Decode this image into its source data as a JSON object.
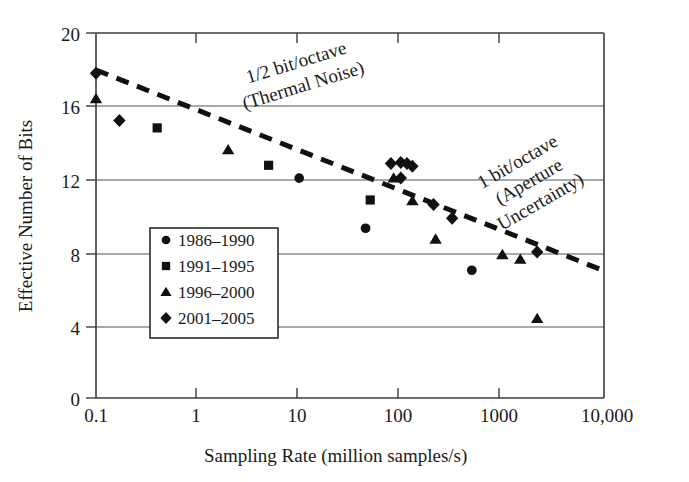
{
  "chart_data": {
    "type": "scatter",
    "title": "",
    "xlabel": "Sampling Rate (million samples/s)",
    "ylabel": "Effective Number of Bits",
    "xscale": "log",
    "yscale": "linear",
    "xlim": [
      0.1,
      10000
    ],
    "ylim": [
      0,
      20
    ],
    "xticks": [
      0.1,
      1,
      10,
      100,
      1000,
      10000
    ],
    "xticklabels": [
      "0.1",
      "1",
      "10",
      "100",
      "1000",
      "10,000"
    ],
    "yticks": [
      0,
      4,
      8,
      12,
      16,
      20
    ],
    "yticklabels": [
      "0",
      "4",
      "8",
      "12",
      "16",
      "20"
    ],
    "grid": "horizontal",
    "legend_position": "lower-left-inside",
    "series": [
      {
        "name": "1986-1990",
        "marker": "circle",
        "points": [
          {
            "x": 10,
            "y": 12.05
          },
          {
            "x": 45,
            "y": 9.3
          },
          {
            "x": 500,
            "y": 7.0
          }
        ]
      },
      {
        "name": "1991-1995",
        "marker": "square",
        "points": [
          {
            "x": 0.4,
            "y": 14.8
          },
          {
            "x": 5,
            "y": 12.75
          },
          {
            "x": 50,
            "y": 10.85
          }
        ]
      },
      {
        "name": "1996-2000",
        "marker": "triangle",
        "points": [
          {
            "x": 0.1,
            "y": 16.4
          },
          {
            "x": 2,
            "y": 13.6
          },
          {
            "x": 85,
            "y": 12.05
          },
          {
            "x": 130,
            "y": 10.8
          },
          {
            "x": 220,
            "y": 8.7
          },
          {
            "x": 1000,
            "y": 7.85
          },
          {
            "x": 1500,
            "y": 7.6
          },
          {
            "x": 2200,
            "y": 4.35
          }
        ]
      },
      {
        "name": "2001-2005",
        "marker": "diamond",
        "points": [
          {
            "x": 0.1,
            "y": 17.8
          },
          {
            "x": 0.17,
            "y": 15.2
          },
          {
            "x": 80,
            "y": 12.85
          },
          {
            "x": 100,
            "y": 12.9
          },
          {
            "x": 115,
            "y": 12.85
          },
          {
            "x": 130,
            "y": 12.7
          },
          {
            "x": 100,
            "y": 12.05
          },
          {
            "x": 210,
            "y": 10.6
          },
          {
            "x": 320,
            "y": 9.85
          },
          {
            "x": 2200,
            "y": 8.0
          }
        ]
      }
    ],
    "trendlines": [
      {
        "name": "thermal-noise",
        "label_line1": "1/2 bit/octave",
        "label_line2": "(Thermal Noise)",
        "slope_description": "1/2 bit per octave",
        "from": {
          "x": 0.1,
          "y": 18.0
        },
        "to": {
          "x": 10000,
          "y": 7.0
        },
        "style": "dashed"
      },
      {
        "name": "aperture-uncertainty",
        "label_line1": "1 bit/octave",
        "label_line2": "(Aperture",
        "label_line3": "Uncertainty)",
        "slope_description": "1 bit per octave",
        "style": "dashed-label-only"
      }
    ],
    "legend_entries": [
      {
        "marker": "circle",
        "label": "1986–1990"
      },
      {
        "marker": "square",
        "label": "1991–1995"
      },
      {
        "marker": "triangle",
        "label": "1996–2000"
      },
      {
        "marker": "diamond",
        "label": "2001–2005"
      }
    ]
  },
  "colors": {
    "marker": "#111111",
    "axis": "#3c3c3c",
    "grid": "#555555",
    "background": "#ffffff"
  }
}
